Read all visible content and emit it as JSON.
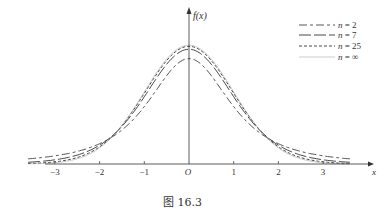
{
  "chart_data": {
    "type": "line",
    "title": "",
    "caption": "图 16.3",
    "xlabel": "x",
    "ylabel": "f(x)",
    "xlim": [
      -3.7,
      3.7
    ],
    "x_ticks": [
      "-3",
      "-2",
      "-1",
      "O",
      "1",
      "2",
      "3"
    ],
    "grid": false,
    "legend_position": "upper right",
    "series": [
      {
        "name": "n = 2",
        "dof": 2,
        "style": "long-short dash",
        "peak": 0.354
      },
      {
        "name": "n = 7",
        "dof": 7,
        "style": "long dash",
        "peak": 0.38
      },
      {
        "name": "n = 25",
        "dof": 25,
        "style": "short dash",
        "peak": 0.395
      },
      {
        "name": "n = ∞",
        "dof": "inf",
        "style": "thin solid",
        "peak": 0.399
      }
    ]
  },
  "axis": {
    "x_label": "x",
    "y_label": "f(x)",
    "origin": "O",
    "ticks": [
      {
        "v": -3,
        "t": "−3"
      },
      {
        "v": -2,
        "t": "−2"
      },
      {
        "v": -1,
        "t": "−1"
      },
      {
        "v": 1,
        "t": "1"
      },
      {
        "v": 2,
        "t": "2"
      },
      {
        "v": 3,
        "t": "3"
      }
    ]
  },
  "legend": [
    "n = 2",
    "n = 7",
    "n = 25",
    "n = ∞"
  ],
  "caption": "图 16.3"
}
